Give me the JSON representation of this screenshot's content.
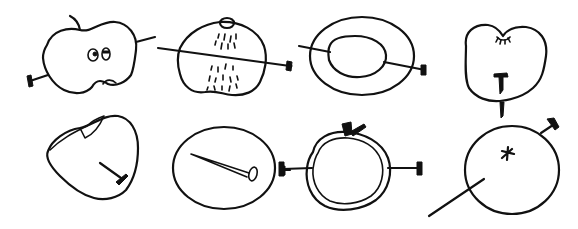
{
  "illustration": {
    "title": "Apples pierced by nails",
    "ink_color": "#111111",
    "background_color": "#ffffff",
    "panels": [
      {
        "id": 1,
        "row": 1,
        "col": 1,
        "description": "Lumpy apple with a stem, two eyes and a small dent, a nail entering lower left and line exiting upper right"
      },
      {
        "id": 2,
        "row": 1,
        "col": 2,
        "description": "Apple cross-section with a knob on top and dotted juice streaks, a nail passing fully through horizontally"
      },
      {
        "id": 3,
        "row": 1,
        "col": 3,
        "description": "Ring-shaped apple slice (outer and inner ellipses) with a nail passing through"
      },
      {
        "id": 4,
        "row": 1,
        "col": 4,
        "description": "Rounded apple with eyelash marks at top, a nail head embedded in the center and a nail tip protruding below"
      },
      {
        "id": 5,
        "row": 2,
        "col": 1,
        "description": "Triangular apple with a bitten top and a nail sticking out at the lower right"
      },
      {
        "id": 6,
        "row": 2,
        "col": 2,
        "description": "Round apple containing a whole nail drawn inside"
      },
      {
        "id": 7,
        "row": 2,
        "col": 3,
        "description": "Double-outlined round apple with a stem/leaf, nail heads on both sides of a horizontal line through it"
      },
      {
        "id": 8,
        "row": 2,
        "col": 4,
        "description": "Round apple with a star-shaped calyx, a nail head at upper right and a long line exiting lower left"
      }
    ]
  }
}
